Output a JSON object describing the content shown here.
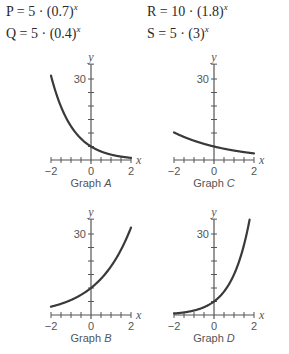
{
  "equations": [
    {
      "name": "P",
      "base_coef": "5",
      "base": "0.7",
      "exp": "x",
      "text": "P = 5 · (0.7)"
    },
    {
      "name": "Q",
      "base_coef": "5",
      "base": "0.4",
      "exp": "x",
      "text": "Q = 5 · (0.4)"
    },
    {
      "name": "R",
      "base_coef": "10",
      "base": "1.8",
      "exp": "x",
      "text": "R = 10 · (1.8)"
    },
    {
      "name": "S",
      "base_coef": "5",
      "base": "3",
      "exp": "x",
      "text": "S = 5 · (3)"
    }
  ],
  "chart_data": [
    {
      "type": "line",
      "title": "Graph A",
      "function": "y = 5·(0.4)^x",
      "xlabel": "x",
      "ylabel": "y",
      "xlim": [
        -2,
        2
      ],
      "ylim": [
        0,
        35
      ],
      "x_ticks": [
        -2,
        0,
        2
      ],
      "y_ticks_labeled": [
        30
      ],
      "y_tick_step": 5,
      "x_tick_step": 0.5,
      "coef": 5,
      "base": 0.4,
      "x": [
        -2,
        -1.5,
        -1,
        -0.5,
        0,
        0.5,
        1,
        1.5,
        2
      ],
      "y": [
        31.25,
        19.76,
        12.5,
        7.91,
        5,
        3.16,
        2,
        1.26,
        0.8
      ]
    },
    {
      "type": "line",
      "title": "Graph C",
      "function": "y = 5·(0.7)^x",
      "xlabel": "x",
      "ylabel": "y",
      "xlim": [
        -2,
        2
      ],
      "ylim": [
        0,
        35
      ],
      "x_ticks": [
        -2,
        0,
        2
      ],
      "y_ticks_labeled": [
        30
      ],
      "y_tick_step": 5,
      "x_tick_step": 0.5,
      "coef": 5,
      "base": 0.7,
      "x": [
        -2,
        -1.5,
        -1,
        -0.5,
        0,
        0.5,
        1,
        1.5,
        2
      ],
      "y": [
        10.2,
        8.54,
        7.14,
        5.98,
        5,
        4.18,
        3.5,
        2.93,
        2.45
      ]
    },
    {
      "type": "line",
      "title": "Graph B",
      "function": "y = 10·(1.8)^x",
      "xlabel": "x",
      "ylabel": "y",
      "xlim": [
        -2,
        2
      ],
      "ylim": [
        0,
        35
      ],
      "x_ticks": [
        -2,
        0,
        2
      ],
      "y_ticks_labeled": [
        30
      ],
      "y_tick_step": 5,
      "x_tick_step": 0.5,
      "coef": 10,
      "base": 1.8,
      "x": [
        -2,
        -1.5,
        -1,
        -0.5,
        0,
        0.5,
        1,
        1.5,
        2
      ],
      "y": [
        3.09,
        4.14,
        5.56,
        7.45,
        10,
        13.42,
        18,
        24.15,
        32.4
      ]
    },
    {
      "type": "line",
      "title": "Graph D",
      "function": "y = 5·(3)^x",
      "xlabel": "x",
      "ylabel": "y",
      "xlim": [
        -2,
        2
      ],
      "ylim": [
        0,
        35
      ],
      "x_ticks": [
        -2,
        0,
        2
      ],
      "y_ticks_labeled": [
        30
      ],
      "y_tick_step": 5,
      "x_tick_step": 0.5,
      "coef": 5,
      "base": 3,
      "x": [
        -2,
        -1.5,
        -1,
        -0.5,
        0,
        0.5,
        1,
        1.5,
        1.8
      ],
      "y": [
        0.56,
        0.96,
        1.67,
        2.89,
        5,
        8.66,
        15,
        25.98,
        36.1
      ]
    }
  ],
  "graphs": [
    {
      "caption_prefix": "Graph ",
      "letter": "A",
      "origin_x": 91,
      "origin_y": 160
    },
    {
      "caption_prefix": "Graph ",
      "letter": "C",
      "origin_x": 214,
      "origin_y": 160
    },
    {
      "caption_prefix": "Graph ",
      "letter": "B",
      "origin_x": 91,
      "origin_y": 315
    },
    {
      "caption_prefix": "Graph ",
      "letter": "D",
      "origin_x": 214,
      "origin_y": 315
    }
  ],
  "colors": {
    "axis": "#555555",
    "curve": "#3a3a3a",
    "text": "#555555"
  }
}
